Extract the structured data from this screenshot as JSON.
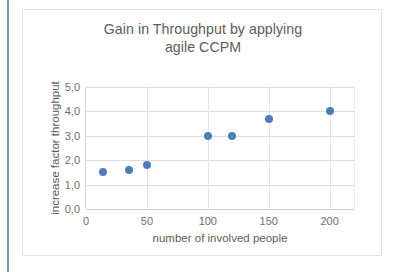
{
  "chart_data": {
    "type": "scatter",
    "title": "Gain in Throughput by applying agile CCPM",
    "title_line1": "Gain in Throughput by applying",
    "title_line2": "agile CCPM",
    "xlabel": "number of involved people",
    "ylabel": "increase factor throughput",
    "xlim": [
      0,
      220
    ],
    "ylim": [
      0,
      5
    ],
    "grid": true,
    "legend": "none",
    "marker_color": "#4e7cb6",
    "xticks": [
      "0",
      "50",
      "100",
      "150",
      "200"
    ],
    "xtick_values": [
      0,
      50,
      100,
      150,
      200
    ],
    "yticks": [
      "0,0",
      "1,0",
      "2,0",
      "3,0",
      "4,0",
      "5,0"
    ],
    "ytick_values": [
      0,
      1,
      2,
      3,
      4,
      5
    ],
    "points": [
      {
        "x": 14,
        "y": 1.5
      },
      {
        "x": 35,
        "y": 1.6
      },
      {
        "x": 50,
        "y": 1.8
      },
      {
        "x": 100,
        "y": 3.0
      },
      {
        "x": 120,
        "y": 3.0
      },
      {
        "x": 150,
        "y": 3.7
      },
      {
        "x": 200,
        "y": 4.0
      }
    ]
  },
  "colors": {
    "marker": "#4e7cb6",
    "text": "#5c5c5c",
    "tick_text": "#6e6e6e",
    "gridline": "#dcdcdc",
    "card_border": "#e2e2e2",
    "page_rule": "#7f95b5"
  }
}
